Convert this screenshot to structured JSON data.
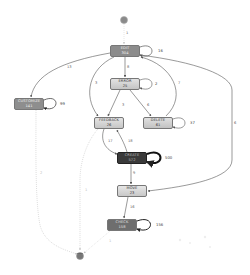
{
  "diagram": {
    "type": "process-map",
    "start_node": {
      "id": "start",
      "x": 124,
      "y": 20
    },
    "end_node": {
      "id": "end",
      "x": 80,
      "y": 255
    },
    "nodes": [
      {
        "id": "edit",
        "name": "EDIT",
        "count": "304",
        "x": 110,
        "y": 45,
        "w": 30,
        "h": 12,
        "fill": "#8c8c8c",
        "text": "#f2f2f2",
        "self_loop": "16"
      },
      {
        "id": "error",
        "name": "ERROR",
        "count": "25",
        "x": 110,
        "y": 78,
        "w": 30,
        "h": 12,
        "fill": "#d0d0d0",
        "text": "#333333",
        "self_loop": "2"
      },
      {
        "id": "customize",
        "name": "CUSTOMIZE",
        "count": "141",
        "x": 14,
        "y": 98,
        "w": 30,
        "h": 12,
        "fill": "#8e8e8e",
        "text": "#f2f2f2",
        "self_loop": "99"
      },
      {
        "id": "feedback",
        "name": "FEEDBACK",
        "count": "26",
        "x": 94,
        "y": 117,
        "w": 30,
        "h": 12,
        "fill": "#d4d4d4",
        "text": "#333333",
        "self_loop": ""
      },
      {
        "id": "delete",
        "name": "DELETE",
        "count": "61",
        "x": 143,
        "y": 117,
        "w": 30,
        "h": 12,
        "fill": "#cfcfcf",
        "text": "#333333",
        "self_loop": "37"
      },
      {
        "id": "create",
        "name": "CREATE",
        "count": "572",
        "x": 117,
        "y": 152,
        "w": 30,
        "h": 12,
        "fill": "#3a3a3a",
        "text": "#bbbbbb",
        "self_loop": "500"
      },
      {
        "id": "move",
        "name": "MOVE",
        "count": "23",
        "x": 117,
        "y": 185,
        "w": 30,
        "h": 12,
        "fill": "#d6d6d6",
        "text": "#333333",
        "self_loop": ""
      },
      {
        "id": "check",
        "name": "CHECK",
        "count": "158",
        "x": 107,
        "y": 219,
        "w": 30,
        "h": 12,
        "fill": "#6e6e6e",
        "text": "#e0e0e0",
        "self_loop": "156"
      }
    ],
    "edges": [
      {
        "from": "start",
        "to": "edit",
        "label": "1"
      },
      {
        "from": "edit",
        "to": "error",
        "label": "8"
      },
      {
        "from": "edit",
        "to": "customize",
        "label": "13"
      },
      {
        "from": "edit",
        "to": "feedback",
        "label": "3"
      },
      {
        "from": "delete",
        "to": "edit",
        "label": "7"
      },
      {
        "from": "edit",
        "to": "move",
        "label": "6"
      },
      {
        "from": "error",
        "to": "feedback",
        "label": "3"
      },
      {
        "from": "error",
        "to": "delete",
        "label": "6"
      },
      {
        "from": "feedback",
        "to": "create",
        "label": "17"
      },
      {
        "from": "create",
        "to": "feedback",
        "label": "18"
      },
      {
        "from": "create",
        "to": "move",
        "label": "9"
      },
      {
        "from": "move",
        "to": "check",
        "label": "16"
      },
      {
        "from": "customize",
        "to": "end",
        "label": "2"
      },
      {
        "from": "feedback",
        "to": "end",
        "label": "1"
      },
      {
        "from": "check",
        "to": "end",
        "label": "1"
      }
    ]
  },
  "labels": {
    "start_to_edit": "1",
    "edit_self": "16",
    "edit_to_customize": "13",
    "edit_to_feedback": "3",
    "edit_to_error": "8",
    "error_self": "2",
    "delete_to_edit": "7",
    "customize_self": "99",
    "error_to_feedback": "3",
    "error_to_delete": "6",
    "delete_self": "37",
    "edit_to_move": "6",
    "feedback_to_create": "17",
    "create_to_feedback": "18",
    "create_self": "500",
    "create_to_move": "9",
    "move_to_check": "16",
    "check_self": "156",
    "customize_to_end": "2",
    "feedback_to_end": "1",
    "check_to_end": "1"
  },
  "colors": {
    "edge": "#555555",
    "dashed_edge": "#bbbbbb",
    "start_fill": "#8a8a8a",
    "end_fill": "#777777"
  }
}
